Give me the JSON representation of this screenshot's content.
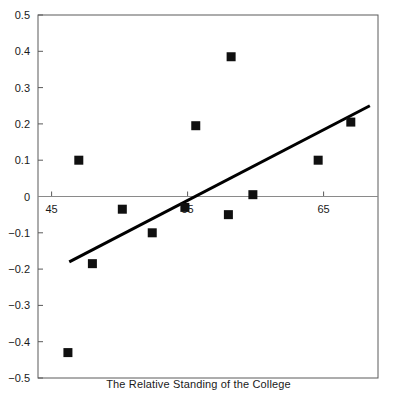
{
  "chart_data": {
    "type": "scatter",
    "title": "",
    "xlabel": "The Relative Standing of the College",
    "ylabel": "",
    "xlim": [
      44.0,
      69.0
    ],
    "ylim": [
      -0.5,
      0.5
    ],
    "xticks": [
      45,
      55,
      65
    ],
    "xtick_labels": [
      "45",
      "55",
      "65"
    ],
    "yticks": [
      -0.5,
      -0.4,
      -0.3,
      -0.2,
      -0.1,
      0,
      0.1,
      0.2,
      0.3,
      0.4,
      0.5
    ],
    "ytick_labels": [
      "−0.5",
      "−0.4",
      "−0.3",
      "−0.2",
      "−0.1",
      "0",
      "0.1",
      "0.2",
      "0.3",
      "0.4",
      "0.5"
    ],
    "grid": false,
    "legend": false,
    "zero_line": true,
    "marker": "square",
    "marker_color": "#101010",
    "marker_size": 9,
    "points": [
      {
        "x": 46.2,
        "y": -0.43
      },
      {
        "x": 47.0,
        "y": 0.1
      },
      {
        "x": 48.0,
        "y": -0.185
      },
      {
        "x": 50.2,
        "y": -0.035
      },
      {
        "x": 52.4,
        "y": -0.1
      },
      {
        "x": 54.8,
        "y": -0.03
      },
      {
        "x": 55.6,
        "y": 0.195
      },
      {
        "x": 58.2,
        "y": 0.385
      },
      {
        "x": 58.0,
        "y": -0.05
      },
      {
        "x": 59.8,
        "y": 0.005
      },
      {
        "x": 64.6,
        "y": 0.1
      },
      {
        "x": 67.0,
        "y": 0.205
      }
    ],
    "trendline": {
      "type": "line",
      "color": "#000000",
      "width": 3,
      "x": [
        46.3,
        68.4
      ],
      "y": [
        -0.18,
        0.25
      ]
    }
  },
  "axes": {
    "frame_color": "#5a5a5a",
    "zero_line_color": "#8a8a8a",
    "tick_color": "#5a5a5a"
  }
}
